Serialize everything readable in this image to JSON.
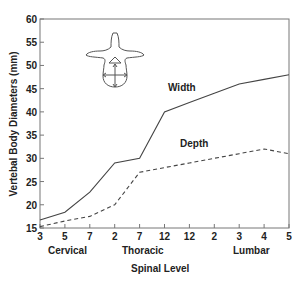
{
  "chart_data": {
    "type": "line",
    "title": "",
    "xlabel": "Spinal Level",
    "ylabel": "Vertebal Body Diameters (mm)",
    "ylim": [
      15,
      60
    ],
    "yticks": [
      15,
      20,
      25,
      30,
      35,
      40,
      45,
      50,
      55,
      60
    ],
    "grid": false,
    "legend": "inline labels",
    "categories": [
      "3",
      "5",
      "7",
      "2",
      "7",
      "12",
      "12",
      "2",
      "3",
      "4",
      "5"
    ],
    "category_groups": [
      {
        "label": "Cervical",
        "center_index": 1
      },
      {
        "label": "Thoracic",
        "center_index": 4
      },
      {
        "label": "Lumbar",
        "center_index": 8.5
      }
    ],
    "series": [
      {
        "name": "Width",
        "style": "solid",
        "values": [
          16.7,
          18.4,
          22.7,
          29,
          30,
          40,
          42,
          44,
          46,
          47,
          48
        ]
      },
      {
        "name": "Depth",
        "style": "dashed",
        "values": [
          15.3,
          16.5,
          17.5,
          20,
          27,
          28,
          29,
          30,
          31,
          32,
          31
        ]
      }
    ],
    "annotations": [
      {
        "type": "icon",
        "name": "vertebra-cross-section",
        "description": "Vertebra outline with arrows indicating width (horizontal) and depth (vertical)"
      }
    ]
  },
  "labels": {
    "width": "Width",
    "depth": "Depth",
    "xlabel": "Spinal Level",
    "ylabel": "Vertebal Body Diameters (mm)",
    "groups": [
      "Cervical",
      "Thoracic",
      "Lumbar"
    ]
  },
  "colors": {
    "line": "#444444",
    "axis": "#777777",
    "text": "#222222"
  }
}
